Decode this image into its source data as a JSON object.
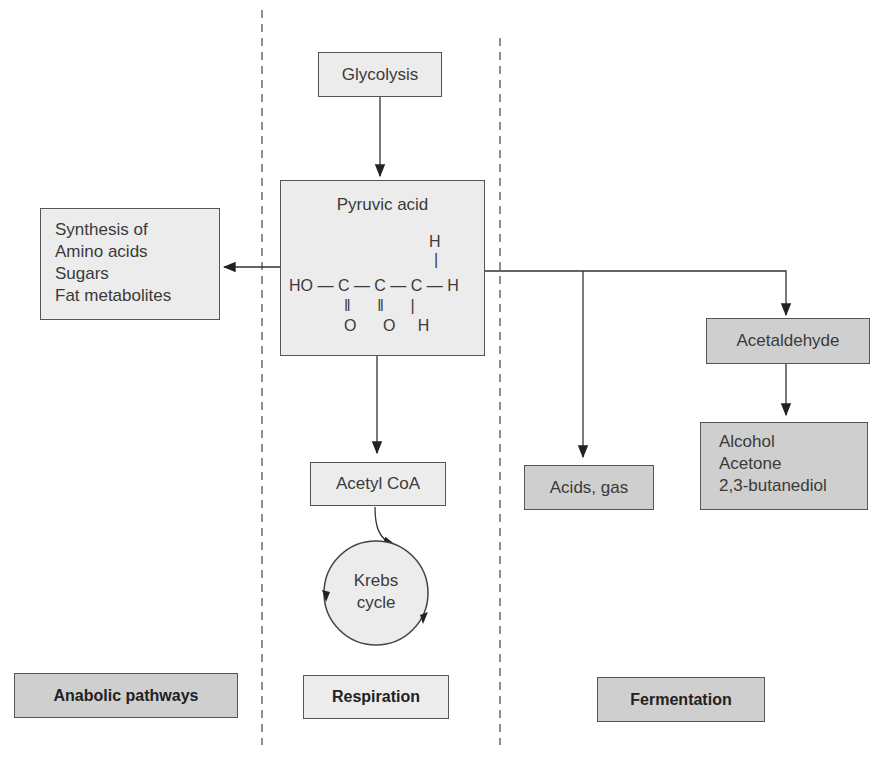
{
  "nodes": {
    "glycolysis": "Glycolysis",
    "pyruvic_acid": "Pyruvic acid",
    "synthesis": [
      "Synthesis of",
      "Amino acids",
      "Sugars",
      "Fat metabolites"
    ],
    "acetyl_coa": "Acetyl CoA",
    "krebs": [
      "Krebs",
      "cycle"
    ],
    "acids_gas": "Acids, gas",
    "acetaldehyde": "Acetaldehyde",
    "products": [
      "Alcohol",
      "Acetone",
      "2,3-butanediol"
    ]
  },
  "formula": {
    "top_h": "H",
    "main": "HO — C — C — C — H",
    "bonds": "‖      ‖      |",
    "bottom": "O      O     H"
  },
  "sections": {
    "anabolic": "Anabolic pathways",
    "respiration": "Respiration",
    "fermentation": "Fermentation"
  },
  "colors": {
    "light_box": "#ececec",
    "dark_box": "#cfcfcf",
    "border": "#555555"
  }
}
